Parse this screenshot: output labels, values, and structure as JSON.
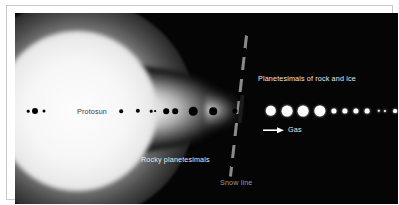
{
  "figure": {
    "background_color": "#050505",
    "labels": {
      "protosun": "Protosun",
      "rocky_planetesimals": "Rocky planetesimals",
      "planetesimals_rock_ice": "Planetesimals of rock and ice",
      "gas": "Gas",
      "snow_line": "Snow line"
    },
    "colors": {
      "sky": "#050505",
      "glow": "#ffffff",
      "rock_body": "#000000",
      "ice_body": "#ffffff",
      "label_light": "#e8e8e8",
      "label_dark": "#3a3a3a",
      "snow_line": "#8a8a8a",
      "frame": "#c9c9c9"
    },
    "icons": {
      "gas_arrow": "arrow-right-icon"
    }
  },
  "chart_data": {
    "type": "scatter",
    "xlabel": "",
    "ylabel": "",
    "grid": false,
    "legend": "none",
    "annotations": [
      {
        "text": "Protosun",
        "x": 70,
        "y": 98,
        "color": "#3a3a3a"
      },
      {
        "text": "Rocky planetesimals",
        "x": 175,
        "y": 147,
        "color": "#e8e8e8"
      },
      {
        "text": "Planetesimals of rock and ice",
        "x": 317,
        "y": 68,
        "color": "#e8e8e8"
      },
      {
        "text": "Gas",
        "x": 276,
        "y": 119,
        "color": "#e8e8e8"
      },
      {
        "text": "Snow line",
        "x": 228,
        "y": 172,
        "color": "#9a9a9a"
      }
    ],
    "snow_line": {
      "x": 230,
      "y_top": 30,
      "y_bottom": 165,
      "style": "dashed",
      "tilt_deg": 6.5
    },
    "series": [
      {
        "name": "Rocky planetesimals",
        "color": "#000000",
        "points": [
          {
            "x": 13,
            "y": 98,
            "r": 1.3
          },
          {
            "x": 20,
            "y": 98,
            "r": 3.0
          },
          {
            "x": 29,
            "y": 98,
            "r": 1.5
          },
          {
            "x": 106,
            "y": 98,
            "r": 1.8
          },
          {
            "x": 123,
            "y": 98,
            "r": 2.2
          },
          {
            "x": 136,
            "y": 98,
            "r": 1.3
          },
          {
            "x": 140,
            "y": 98,
            "r": 0.9
          },
          {
            "x": 151,
            "y": 98,
            "r": 2.8
          },
          {
            "x": 160,
            "y": 98,
            "r": 2.8
          },
          {
            "x": 178,
            "y": 98,
            "r": 4.3
          },
          {
            "x": 198,
            "y": 98,
            "r": 3.8
          },
          {
            "x": 220,
            "y": 98,
            "r": 2.6
          }
        ]
      },
      {
        "name": "Planetesimals of rock and ice",
        "color": "#ffffff",
        "points": [
          {
            "x": 256,
            "y": 98,
            "r": 5.2
          },
          {
            "x": 272,
            "y": 98,
            "r": 5.4
          },
          {
            "x": 288,
            "y": 98,
            "r": 5.4
          },
          {
            "x": 305,
            "y": 98,
            "r": 5.6
          },
          {
            "x": 319,
            "y": 98,
            "r": 2.6
          },
          {
            "x": 330,
            "y": 98,
            "r": 2.6
          },
          {
            "x": 341,
            "y": 98,
            "r": 2.6
          },
          {
            "x": 352,
            "y": 98,
            "r": 2.4
          },
          {
            "x": 364,
            "y": 98,
            "r": 1.2
          },
          {
            "x": 370,
            "y": 98,
            "r": 1.1
          },
          {
            "x": 380,
            "y": 98,
            "r": 1.9
          }
        ]
      }
    ]
  }
}
